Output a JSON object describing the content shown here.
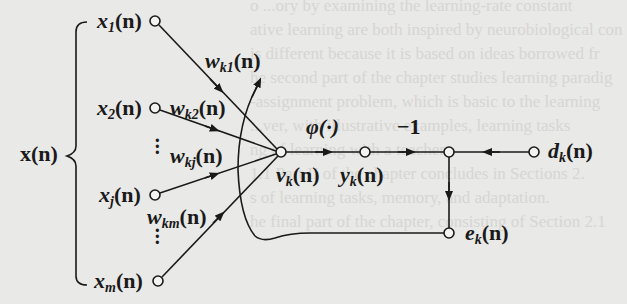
{
  "diagram": {
    "type": "signal-flow-graph",
    "title": "",
    "input_vector_label": "x(n)",
    "inputs": [
      {
        "label": "x",
        "sub": "1",
        "arg": "(n)"
      },
      {
        "label": "x",
        "sub": "2",
        "arg": "(n)"
      },
      {
        "label": "x",
        "sub": "j",
        "arg": "(n)"
      },
      {
        "label": "x",
        "sub": "m",
        "arg": "(n)"
      }
    ],
    "weights": [
      {
        "label": "w",
        "sub": "k1",
        "arg": "(n)"
      },
      {
        "label": "w",
        "sub": "k2",
        "arg": "(n)"
      },
      {
        "label": "w",
        "sub": "kj",
        "arg": "(n)"
      },
      {
        "label": "w",
        "sub": "km",
        "arg": "(n)"
      }
    ],
    "induced_field": {
      "label": "v",
      "sub": "k",
      "arg": "(n)"
    },
    "activation": "φ(·)",
    "output": {
      "label": "y",
      "sub": "k",
      "arg": "(n)"
    },
    "negation_gain": "−1",
    "desired": {
      "label": "d",
      "sub": "k",
      "arg": "(n)"
    },
    "error": {
      "label": "e",
      "sub": "k",
      "arg": "(n)"
    },
    "ellipsis": "⋮",
    "colors": {
      "ink": "#1a1a1a",
      "paper": "#e9e9e7"
    }
  },
  "background_text": [
    "o ...ory by examining the learning-rate constant",
    "ative learning are both inspired by neurobiological con",
    "is different because it is based on ideas borrowed fr",
    "he second part of the chapter studies learning paradig",
    "-assignment problem, which is basic to the learning",
    "...ver, with illustrative examples, learning tasks",
    "ng of learning with a teacher",
    "1.1 Part II of the chapter concludes in Sections 2.",
    "s of learning tasks, memory, and adaptation.",
    "he final part of the chapter, consisting of Section 2.1"
  ]
}
